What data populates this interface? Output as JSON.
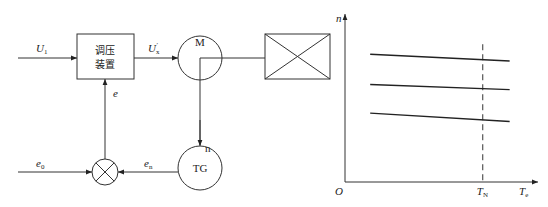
{
  "block_diagram": {
    "input_signal": {
      "symbol": "U",
      "subscript": "1"
    },
    "regulator_box": {
      "line1": "调压",
      "line2": "装置"
    },
    "regulator_output": {
      "symbol": "U",
      "subscript": "x",
      "prime": "′"
    },
    "motor": {
      "label": "M"
    },
    "load": {
      "label": ""
    },
    "speed_signal": {
      "label": "n"
    },
    "tachogenerator": {
      "label": "TG"
    },
    "reference": {
      "symbol": "e",
      "subscript": "0"
    },
    "feedback": {
      "symbol": "e",
      "subscript": "n"
    },
    "error": {
      "symbol": "e"
    }
  },
  "chart_data": {
    "type": "line",
    "title": "",
    "xlabel": {
      "symbol": "T",
      "subscript": "e"
    },
    "ylabel": "n",
    "origin_label": "O",
    "rated_marker": {
      "symbol": "T",
      "subscript": "N",
      "x": 0.82
    },
    "xlim": [
      0,
      1
    ],
    "ylim": [
      0,
      1
    ],
    "grid": false,
    "series": [
      {
        "name": "high-speed",
        "x": [
          0.15,
          0.98
        ],
        "y": [
          0.76,
          0.72
        ]
      },
      {
        "name": "mid-speed",
        "x": [
          0.15,
          0.98
        ],
        "y": [
          0.58,
          0.55
        ]
      },
      {
        "name": "low-speed",
        "x": [
          0.15,
          0.98
        ],
        "y": [
          0.41,
          0.36
        ]
      }
    ]
  }
}
